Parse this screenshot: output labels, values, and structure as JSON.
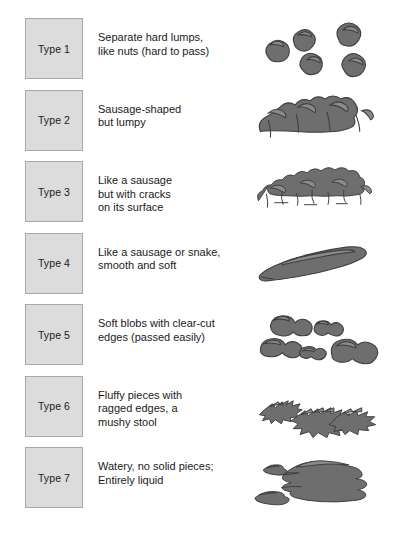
{
  "chart": {
    "rows": [
      {
        "type_label": "Type 1",
        "description_lines": [
          "Separate hard lumps,",
          "like nuts (hard to pass)"
        ],
        "illustration": "separate-hard-lumps"
      },
      {
        "type_label": "Type 2",
        "description_lines": [
          "Sausage-shaped",
          "but lumpy"
        ],
        "illustration": "lumpy-sausage"
      },
      {
        "type_label": "Type 3",
        "description_lines": [
          "Like a sausage",
          "but with cracks",
          "on its surface"
        ],
        "illustration": "cracked-sausage"
      },
      {
        "type_label": "Type 4",
        "description_lines": [
          "Like a sausage or snake,",
          "smooth and soft"
        ],
        "illustration": "smooth-sausage"
      },
      {
        "type_label": "Type 5",
        "description_lines": [
          "Soft blobs with clear-cut",
          "edges (passed easily)"
        ],
        "illustration": "soft-blobs"
      },
      {
        "type_label": "Type 6",
        "description_lines": [
          "Fluffy pieces with",
          "ragged edges, a",
          "mushy stool"
        ],
        "illustration": "fluffy-ragged-pieces"
      },
      {
        "type_label": "Type 7",
        "description_lines": [
          "Watery, no solid pieces;",
          "Entirely liquid"
        ],
        "illustration": "watery-liquid"
      }
    ],
    "colors": {
      "background": "#ffffff",
      "box_fill": "#dcdcdc",
      "box_border": "#a8a8a8",
      "text": "#1a1a1a",
      "illustration_fill": "#6e6e6e",
      "illustration_highlight": "#8a8a8a",
      "illustration_stroke": "#3f3f3f"
    }
  }
}
